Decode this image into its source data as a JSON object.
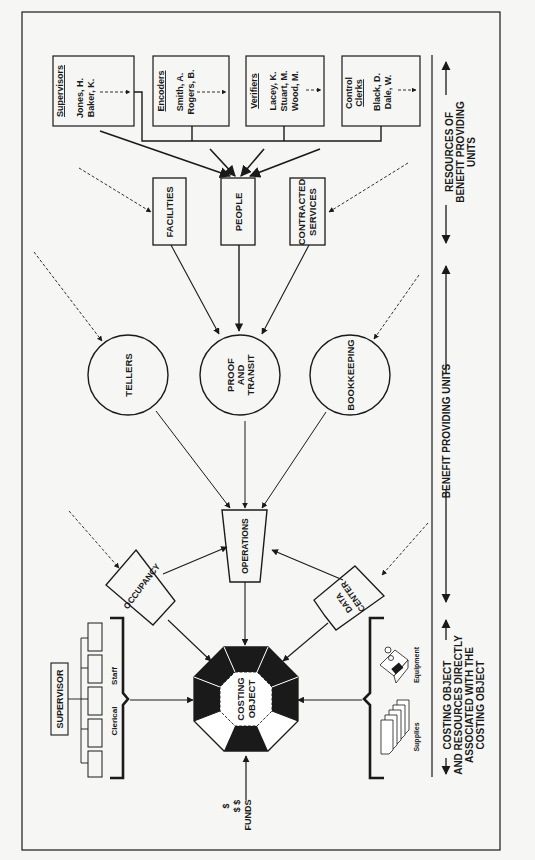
{
  "resources": [
    {
      "title": "Supervisors",
      "names": [
        "Jones, H.",
        "Baker, K."
      ]
    },
    {
      "title": "Encoders",
      "names": [
        "Smith, A.",
        "Rogers, B."
      ]
    },
    {
      "title": "Verifiers",
      "names": [
        "Lacey, K.",
        "Stuart, M.",
        "Wood, M."
      ]
    },
    {
      "title_lines": [
        "Control",
        "Clerks"
      ],
      "names": [
        "Black, D.",
        "Dale, W."
      ]
    }
  ],
  "resource_types": {
    "facilities": "FACILITIES",
    "people": "PEOPLE",
    "contracted": [
      "CONTRACTED",
      "SERVICES"
    ]
  },
  "benefit_units": {
    "tellers": "TELLERS",
    "proof": [
      "PROOF",
      "AND",
      "TRANSIT"
    ],
    "bookkeeping": "BOOKKEEPING"
  },
  "operations": "OPERATIONS",
  "occupancy": "OCCUPANCY",
  "data_center": [
    "DATA",
    "CENTER"
  ],
  "costing_object": [
    "COSTING",
    "OBJECT"
  ],
  "left_group": {
    "supervisor": "SUPERVISOR",
    "clerical": "Clerical",
    "staff": "Staff"
  },
  "right_group": {
    "equipment": "Equipment",
    "supplies": "Supplies"
  },
  "funds": {
    "label": "FUNDS",
    "symbols": [
      "$",
      "$ $"
    ]
  },
  "side_labels": {
    "resources": [
      "RESOURCES OF",
      "BENEFIT PROVIDING",
      "UNITS"
    ],
    "benefit": "BENEFIT PROVIDING UNITS",
    "costing": [
      "COSTING OBJECT",
      "AND RESOURCES DIRECTLY",
      "ASSOCIATED WITH THE",
      "COSTING OBJECT"
    ]
  },
  "colors": {
    "ink": "#1a1a1a",
    "paper": "#f6f6f4"
  }
}
